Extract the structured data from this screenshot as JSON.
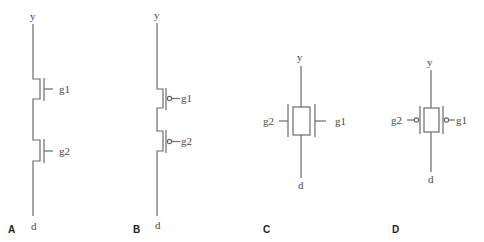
{
  "figure": {
    "panels": [
      {
        "id": "A",
        "label": "A",
        "description": "Two NMOS transistors in series",
        "top_node": "y",
        "bottom_node": "d",
        "gates": [
          "g1",
          "g2"
        ],
        "bubbles": false
      },
      {
        "id": "B",
        "label": "B",
        "description": "Two PMOS transistors in series",
        "top_node": "y",
        "bottom_node": "d",
        "gates": [
          "g1",
          "g2"
        ],
        "bubbles": true
      },
      {
        "id": "C",
        "label": "C",
        "description": "Double-gate NMOS device",
        "top_node": "y",
        "bottom_node": "d",
        "left_gate": "g2",
        "right_gate": "g1",
        "bubbles": false
      },
      {
        "id": "D",
        "label": "D",
        "description": "Double-gate PMOS device",
        "top_node": "y",
        "bottom_node": "d",
        "left_gate": "g2",
        "right_gate": "g1",
        "bubbles": true
      }
    ]
  },
  "colors": {
    "wire": "#6b6b6b",
    "text": "#4a4a4a",
    "panel_label": "#222222"
  }
}
